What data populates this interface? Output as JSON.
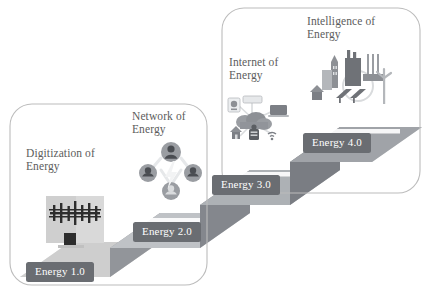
{
  "diagram": {
    "background": "#ffffff",
    "palette": {
      "badge_bg": "#6a6d72",
      "badge_text": "#ffffff",
      "heading_text": "#5c5c5c",
      "step_top": "#d6d6d6",
      "step_top_light": "#e2e2e2",
      "step_riser": "#8e9196",
      "step_riser_dark": "#7c7f85",
      "group_box_stroke": "#b9b9b9",
      "icon_dark": "#2f2f2f",
      "icon_mid": "#9a9da2",
      "icon_light": "#cfd2d6"
    },
    "group_boxes": [
      {
        "name": "left-group-box",
        "x": 10,
        "y": 104,
        "w": 197,
        "h": 181,
        "radius": 22
      },
      {
        "name": "right-group-box",
        "x": 222,
        "y": 8,
        "w": 198,
        "h": 185,
        "radius": 22
      }
    ],
    "steps": [
      {
        "id": "step-1",
        "stage_label": "Energy 1.0",
        "heading": "Digitization of\nEnergy",
        "icon_name": "power-pylon-icon",
        "icon_description": "electric transmission tower on a screen",
        "heading_x": 26,
        "heading_y": 147,
        "badge_x": 26,
        "badge_y": 262
      },
      {
        "id": "step-2",
        "stage_label": "Energy 2.0",
        "heading": "Network of\nEnergy",
        "icon_name": "people-network-icon",
        "icon_description": "four connected user avatars around a lightning bolt",
        "heading_x": 132,
        "heading_y": 110,
        "badge_x": 133,
        "badge_y": 222
      },
      {
        "id": "step-3",
        "stage_label": "Energy 3.0",
        "heading": "Internet of\nEnergy",
        "icon_name": "iot-cloud-icon",
        "icon_description": "cloud connected to home, laptop, meter and devices",
        "heading_x": 229,
        "heading_y": 56,
        "badge_x": 212,
        "badge_y": 175
      },
      {
        "id": "step-4",
        "stage_label": "Energy 4.0",
        "heading": "Intelligence of\nEnergy",
        "icon_name": "smart-city-icon",
        "icon_description": "city skyline with factory, wind turbine and solar panels",
        "heading_x": 307,
        "heading_y": 15,
        "badge_x": 303,
        "badge_y": 133
      }
    ]
  }
}
